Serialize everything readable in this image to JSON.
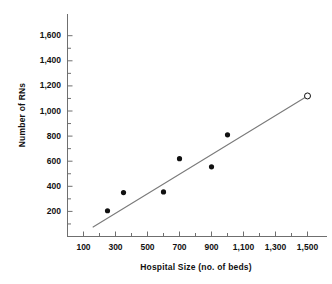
{
  "chart_data": {
    "type": "scatter",
    "title": "",
    "xlabel": "Hospital Size (no. of beds)",
    "ylabel": "Number of RNs",
    "xlim": [
      0,
      1600
    ],
    "ylim": [
      0,
      1700
    ],
    "grid": false,
    "legend": "none",
    "x_major_ticks": [
      100,
      300,
      500,
      700,
      900,
      1100,
      1300,
      1500
    ],
    "x_major_tick_labels": [
      "100",
      "300",
      "500",
      "700",
      "900",
      "1,100",
      "1,300",
      "1,500"
    ],
    "x_minor_ticks": [
      200,
      400,
      600,
      800,
      1000,
      1200,
      1400
    ],
    "y_major_ticks": [
      200,
      400,
      600,
      800,
      1000,
      1200,
      1400,
      1600
    ],
    "y_major_tick_labels": [
      "200",
      "400",
      "600",
      "800",
      "1,000",
      "1,200",
      "1,400",
      "1,600"
    ],
    "y_minor_ticks": [
      100,
      300,
      500,
      700,
      900,
      1100,
      1300,
      1500
    ],
    "points": [
      {
        "x": 250,
        "y": 205,
        "marker": "filled-circle"
      },
      {
        "x": 350,
        "y": 350,
        "marker": "filled-circle"
      },
      {
        "x": 600,
        "y": 355,
        "marker": "filled-circle"
      },
      {
        "x": 700,
        "y": 620,
        "marker": "filled-circle"
      },
      {
        "x": 900,
        "y": 555,
        "marker": "filled-circle"
      },
      {
        "x": 1000,
        "y": 810,
        "marker": "filled-circle"
      },
      {
        "x": 1500,
        "y": 1120,
        "marker": "open-circle"
      }
    ],
    "trend_line": {
      "type": "line",
      "x": [
        160,
        1500
      ],
      "y": [
        75,
        1120
      ],
      "color": "#7a7a7a"
    },
    "colors": {
      "marker_fill": "#111111",
      "open_marker_stroke": "#111111",
      "trend_line": "#7a7a7a",
      "axis": "#6f6f6f",
      "text": "#111111",
      "background": "#ffffff"
    }
  }
}
